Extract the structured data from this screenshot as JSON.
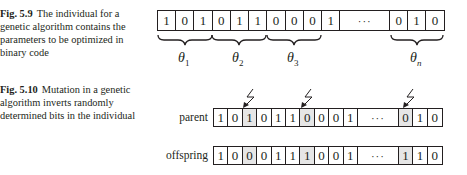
{
  "figures": [
    {
      "number": "Fig. 5.9",
      "caption": "The individual for a genetic algorithm contains the parameters to be optimized in binary code",
      "individual": {
        "bits_head": [
          "1",
          "0",
          "1",
          "0",
          "1",
          "1",
          "0",
          "0",
          "0",
          "1"
        ],
        "ellipsis": "···",
        "bits_tail": [
          "0",
          "1",
          "0"
        ]
      },
      "parameter_groups": [
        {
          "symbol": "θ",
          "subscript": "1"
        },
        {
          "symbol": "θ",
          "subscript": "2"
        },
        {
          "symbol": "θ",
          "subscript": "3"
        },
        {
          "symbol": "θ",
          "subscript": "n"
        }
      ]
    },
    {
      "number": "Fig. 5.10",
      "caption": "Mutation in a genetic algorithm inverts randomly determined bits in the individual",
      "rows": [
        {
          "label": "parent",
          "bits_head": [
            "1",
            "0",
            "1",
            "0",
            "1",
            "1",
            "0",
            "0",
            "0",
            "1"
          ],
          "ellipsis": "···",
          "bits_tail": [
            "0",
            "1",
            "0"
          ]
        },
        {
          "label": "offspring",
          "bits_head": [
            "1",
            "0",
            "0",
            "0",
            "1",
            "1",
            "1",
            "0",
            "0",
            "1"
          ],
          "ellipsis": "···",
          "bits_tail": [
            "1",
            "1",
            "0"
          ]
        }
      ],
      "mutated_positions": [
        "head-3",
        "head-7",
        "tail-1"
      ],
      "mutation_icon": "lightning-bolt-arrow-icon"
    }
  ]
}
